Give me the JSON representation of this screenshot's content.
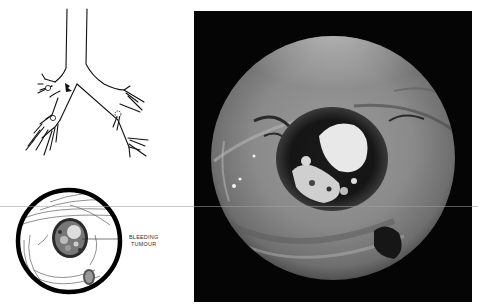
{
  "figure": {
    "diagram_top": {
      "subject": "bronchial tree line drawing",
      "marker": "arrow pointing to tumour site"
    },
    "diagram_bottom": {
      "subject": "circular bronchoscopic view sketch",
      "label_lines": [
        "BLEEDING",
        "TUMOUR"
      ]
    },
    "photo": {
      "subject": "bronchoscopic photograph of bleeding tumour",
      "frame_color": "#050505"
    }
  }
}
